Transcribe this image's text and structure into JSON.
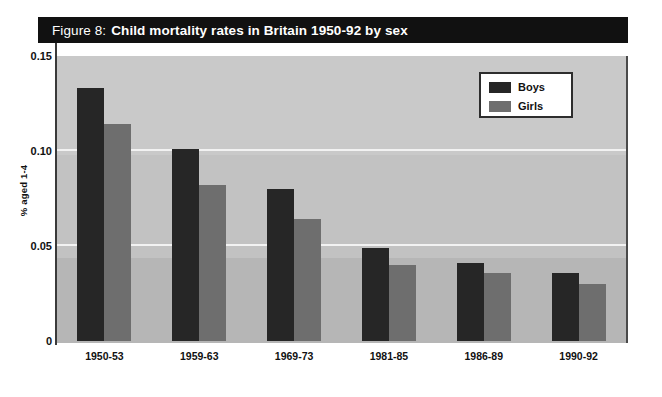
{
  "figure": {
    "title_prefix": "Figure 8:",
    "title_main": "Child mortality rates in Britain 1950-92 by sex"
  },
  "colors": {
    "boys": "#262626",
    "girls": "#6e6e6e",
    "plot_background": "#c9c9c9",
    "gridline": "#f2f2f2",
    "title_bar": "#111111",
    "axis": "#3a3a3a"
  },
  "legend": {
    "position": "top-right",
    "entries": [
      {
        "label": "Boys",
        "color": "#262626"
      },
      {
        "label": "Girls",
        "color": "#6e6e6e"
      }
    ]
  },
  "chart_data": {
    "type": "bar",
    "title": "Figure 8: Child mortality rates in Britain 1950-92 by sex",
    "xlabel": "",
    "ylabel": "% aged 1-4",
    "categories": [
      "1950-53",
      "1959-63",
      "1969-73",
      "1981-85",
      "1986-89",
      "1990-92"
    ],
    "series": [
      {
        "name": "Boys",
        "color": "#262626",
        "values": [
          0.133,
          0.101,
          0.08,
          0.049,
          0.041,
          0.036
        ]
      },
      {
        "name": "Girls",
        "color": "#6e6e6e",
        "values": [
          0.114,
          0.082,
          0.064,
          0.04,
          0.036,
          0.03
        ]
      }
    ],
    "ylim": [
      0,
      0.15
    ],
    "yticks": [
      0,
      0.05,
      0.1,
      0.15
    ],
    "ytick_labels": [
      "0",
      "0.05",
      "0.10",
      "0.15"
    ],
    "grid": true,
    "legend_position": "top-right"
  }
}
